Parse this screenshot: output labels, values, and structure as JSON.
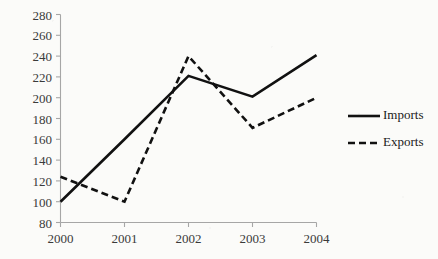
{
  "chart_data": {
    "type": "line",
    "title": "",
    "xlabel": "",
    "ylabel": "",
    "categories": [
      "2000",
      "2001",
      "2002",
      "2003",
      "2004"
    ],
    "x": [
      2000,
      2001,
      2002,
      2003,
      2004
    ],
    "series": [
      {
        "name": "Imports",
        "style": "solid",
        "values": [
          100,
          160,
          221,
          201,
          241
        ]
      },
      {
        "name": "Exports",
        "style": "dashed",
        "values": [
          124,
          100,
          240,
          171,
          200
        ]
      }
    ],
    "ylim": [
      80,
      280
    ],
    "yticks": [
      80,
      100,
      120,
      140,
      160,
      180,
      200,
      220,
      240,
      260,
      280
    ],
    "ytick_labels": [
      "80",
      "100",
      "120",
      "140",
      "160",
      "180",
      "200",
      "220",
      "240",
      "260",
      "280"
    ],
    "xtick_labels": [
      "2000",
      "2001",
      "2002",
      "2003",
      "2004"
    ],
    "grid": false,
    "legend_position": "right",
    "legend": [
      "Imports",
      "Exports"
    ],
    "colors": {
      "line": "#111111",
      "axis": "#a6a6a6",
      "tick_text": "#3a3a3a",
      "background": "#fbfbf9"
    }
  },
  "axis": {
    "y_labels": [
      "280",
      "260",
      "240",
      "220",
      "200",
      "180",
      "160",
      "140",
      "120",
      "100",
      "80"
    ],
    "x_labels": [
      "2000",
      "2001",
      "2002",
      "2003",
      "2004"
    ]
  },
  "legend": {
    "items": [
      {
        "label": "Imports"
      },
      {
        "label": "Exports"
      }
    ]
  }
}
